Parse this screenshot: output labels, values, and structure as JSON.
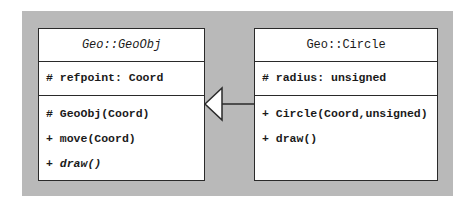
{
  "diagram": {
    "type": "uml-class-diagram",
    "colors": {
      "background_panel": "#b9b9b9",
      "box_fill": "#ffffff",
      "stroke": "#2a2a2a"
    },
    "classes": [
      {
        "name": "Geo::GeoObj",
        "abstract": true,
        "attributes": [
          "# refpoint: Coord"
        ],
        "operations": [
          {
            "text": "# GeoObj(Coord)",
            "abstract": false
          },
          {
            "text": "+ move(Coord)",
            "abstract": false
          },
          {
            "text": "+ draw()",
            "abstract": true
          }
        ]
      },
      {
        "name": "Geo::Circle",
        "abstract": false,
        "attributes": [
          "# radius: unsigned"
        ],
        "operations": [
          {
            "text": "+ Circle(Coord,unsigned)",
            "abstract": false
          },
          {
            "text": "+ draw()",
            "abstract": false
          }
        ]
      }
    ],
    "relationships": [
      {
        "type": "generalization",
        "from": "Geo::Circle",
        "to": "Geo::GeoObj"
      }
    ]
  }
}
